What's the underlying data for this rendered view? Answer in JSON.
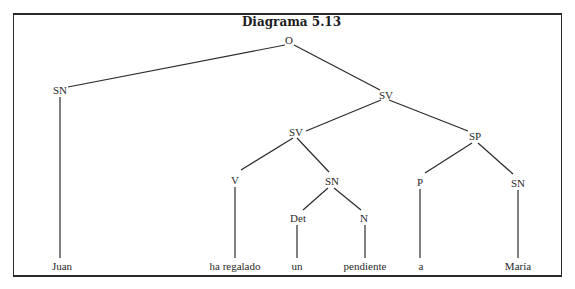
{
  "diagram": {
    "title": "Diagrama 5.13",
    "line_color": "#2a2a2a",
    "nodes": {
      "o": {
        "label": "O",
        "x": 289,
        "y": 40
      },
      "sn1": {
        "label": "SN",
        "x": 60,
        "y": 90
      },
      "sv1": {
        "label": "SV",
        "x": 386,
        "y": 95
      },
      "sv2": {
        "label": "SV",
        "x": 296,
        "y": 132
      },
      "sp": {
        "label": "SP",
        "x": 475,
        "y": 135
      },
      "v": {
        "label": "V",
        "x": 235,
        "y": 180
      },
      "sn2": {
        "label": "SN",
        "x": 333,
        "y": 180
      },
      "p": {
        "label": "P",
        "x": 420,
        "y": 181
      },
      "sn3": {
        "label": "SN",
        "x": 518,
        "y": 183
      },
      "det": {
        "label": "Det",
        "x": 298,
        "y": 218
      },
      "n": {
        "label": "N",
        "x": 364,
        "y": 218
      },
      "juan": {
        "label": "Juan",
        "x": 62,
        "y": 266
      },
      "ha_regalado": {
        "label": "ha regalado",
        "x": 235,
        "y": 266
      },
      "un": {
        "label": "un",
        "x": 297,
        "y": 266
      },
      "pendiente": {
        "label": "pendiente",
        "x": 365,
        "y": 266
      },
      "a": {
        "label": "a",
        "x": 420,
        "y": 266
      },
      "maria": {
        "label": "María",
        "x": 518,
        "y": 266
      }
    },
    "edges": [
      [
        "o",
        "sn1"
      ],
      [
        "o",
        "sv1"
      ],
      [
        "sn1",
        "juan"
      ],
      [
        "sv1",
        "sv2"
      ],
      [
        "sv1",
        "sp"
      ],
      [
        "sv2",
        "v"
      ],
      [
        "sv2",
        "sn2"
      ],
      [
        "v",
        "ha_regalado"
      ],
      [
        "sn2",
        "det"
      ],
      [
        "sn2",
        "n"
      ],
      [
        "det",
        "un"
      ],
      [
        "n",
        "pendiente"
      ],
      [
        "sp",
        "p"
      ],
      [
        "sp",
        "sn3"
      ],
      [
        "p",
        "a"
      ],
      [
        "sn3",
        "maria"
      ]
    ]
  }
}
